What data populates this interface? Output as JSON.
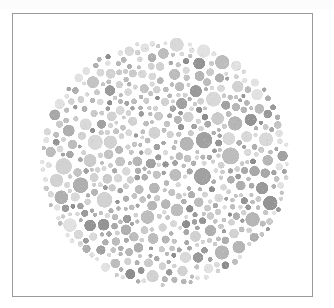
{
  "page": {
    "background_color": "#ffffff",
    "width": 334,
    "height": 308,
    "scan_band_color": "#fcfcfc"
  },
  "frame": {
    "x": 12,
    "y": 13,
    "width": 301,
    "height": 284,
    "border_color": "#9a9a9a",
    "border_width": 1,
    "fill_color": "#ffffff"
  },
  "plate": {
    "type": "ishihara-color-vision-test-plate",
    "rendering": "grayscale",
    "hidden_figure_visible": false,
    "center_x": 152,
    "center_y": 148,
    "radius": 126,
    "background_color": "#ffffff",
    "dot_count": 1150,
    "dot_radius_min": 2.0,
    "dot_radius_max": 9.5,
    "dot_gap": 0.7,
    "speckle_opacity": 0.22,
    "palette": [
      "#d9d9d9",
      "#d2d2d2",
      "#cbcbcb",
      "#c4c4c4",
      "#bdbdbd",
      "#b6b6b6",
      "#afafaf",
      "#a8a8a8",
      "#a1a1a1",
      "#9a9a9a",
      "#949494"
    ],
    "palette_weights": [
      12,
      13,
      13,
      12,
      11,
      10,
      9,
      7,
      6,
      4,
      3
    ],
    "dark_accent_color": "#8d8d8d",
    "dark_accent_fraction": 0.05,
    "edge_ring_color": "#e2e2e2",
    "seed": 20240613
  }
}
